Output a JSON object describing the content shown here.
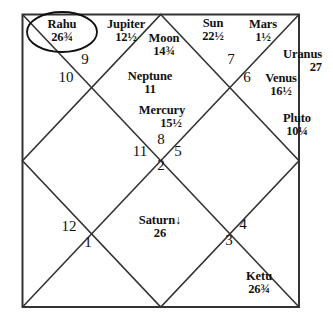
{
  "chart": {
    "type": "north-indian-vedic-birth-chart",
    "frame": {
      "left": 22,
      "top": 14,
      "right": 299,
      "bottom": 307,
      "line_color": "#333333"
    },
    "planets": [
      {
        "id": "rahu",
        "name": "Rahu",
        "degree": "26¾",
        "circled": true,
        "retrograde": false,
        "house": 9,
        "x": 62,
        "y": 18,
        "align": "center"
      },
      {
        "id": "jupiter",
        "name": "Jupiter",
        "degree": "12½",
        "circled": false,
        "retrograde": false,
        "house": 10,
        "x": 126,
        "y": 18,
        "align": "center"
      },
      {
        "id": "moon",
        "name": "Moon",
        "degree": "14¾",
        "circled": false,
        "retrograde": false,
        "house": 10,
        "x": 164,
        "y": 32,
        "align": "center"
      },
      {
        "id": "sun",
        "name": "Sun",
        "degree": "22½",
        "circled": false,
        "retrograde": false,
        "house": 11,
        "x": 213,
        "y": 17,
        "align": "center"
      },
      {
        "id": "mars",
        "name": "Mars",
        "degree": "1½",
        "circled": false,
        "retrograde": false,
        "house": 11,
        "x": 263,
        "y": 18,
        "align": "center"
      },
      {
        "id": "uranus",
        "name": "Uranus",
        "degree": "27",
        "circled": false,
        "retrograde": false,
        "house": 12,
        "x": 304,
        "y": 48,
        "align": "left"
      },
      {
        "id": "venus",
        "name": "Venus",
        "degree": "16½",
        "circled": false,
        "retrograde": false,
        "house": 12,
        "x": 281,
        "y": 72,
        "align": "center"
      },
      {
        "id": "neptune",
        "name": "Neptune",
        "degree": "11",
        "circled": false,
        "retrograde": false,
        "house": 10,
        "x": 150,
        "y": 70,
        "align": "center"
      },
      {
        "id": "pluto",
        "name": "Pluto",
        "degree": "10¼",
        "circled": false,
        "retrograde": false,
        "house": 12,
        "x": 297,
        "y": 112,
        "align": "center"
      },
      {
        "id": "mercury",
        "name": "Mercury",
        "degree": "15½",
        "circled": false,
        "retrograde": false,
        "house": 10,
        "x": 162,
        "y": 104,
        "align": "center"
      },
      {
        "id": "saturn",
        "name": "Saturn",
        "degree": "26",
        "circled": false,
        "retrograde": true,
        "house": 1,
        "x": 160,
        "y": 214,
        "align": "center"
      },
      {
        "id": "ketu",
        "name": "Ketu",
        "degree": "26¾",
        "circled": false,
        "retrograde": false,
        "house": 3,
        "x": 259,
        "y": 270,
        "align": "center"
      }
    ],
    "retrograde_glyph": "↓",
    "houses": [
      {
        "number": "9",
        "x": 85,
        "y": 60
      },
      {
        "number": "10",
        "x": 66,
        "y": 78
      },
      {
        "number": "7",
        "x": 231,
        "y": 60
      },
      {
        "number": "6",
        "x": 247,
        "y": 78
      },
      {
        "number": "8",
        "x": 161,
        "y": 140
      },
      {
        "number": "11",
        "x": 140,
        "y": 152
      },
      {
        "number": "5",
        "x": 178,
        "y": 152
      },
      {
        "number": "2",
        "x": 161,
        "y": 166
      },
      {
        "number": "12",
        "x": 69,
        "y": 227
      },
      {
        "number": "1",
        "x": 88,
        "y": 243
      },
      {
        "number": "4",
        "x": 243,
        "y": 225
      },
      {
        "number": "3",
        "x": 229,
        "y": 241
      }
    ]
  }
}
